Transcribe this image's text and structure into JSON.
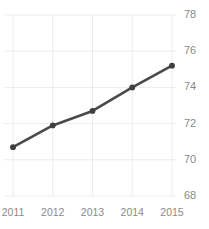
{
  "chart_data": {
    "type": "line",
    "title": "Freedom Trend",
    "xlabel": "",
    "ylabel": "",
    "categories": [
      "2011",
      "2012",
      "2013",
      "2014",
      "2015"
    ],
    "x": [
      2011,
      2012,
      2013,
      2014,
      2015
    ],
    "values": [
      70.7,
      71.9,
      72.7,
      74.0,
      75.2
    ],
    "series": [
      {
        "name": "Freedom Trend",
        "values": [
          70.7,
          71.9,
          72.7,
          74.0,
          75.2
        ]
      }
    ],
    "ylim": [
      68,
      78
    ],
    "yticks": [
      68,
      70,
      72,
      74,
      76,
      78
    ],
    "ytick_labels": [
      "68",
      "70",
      "72",
      "74",
      "76",
      "78"
    ],
    "xtick_labels": [
      "2011",
      "2012",
      "2013",
      "2014",
      "2015"
    ],
    "grid": true,
    "y_axis_position": "right",
    "legend": false,
    "legend_position": "none",
    "line_color": "#4a4a4a",
    "marker_color": "#3f3f3f",
    "grid_color": "#ececec",
    "tick_label_color": "#8a8a8a",
    "background_color": "#ffffff"
  }
}
